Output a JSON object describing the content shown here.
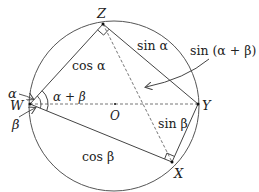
{
  "diagram": {
    "circle": {
      "cx": 114,
      "cy": 106,
      "r": 85,
      "stroke": "#555555"
    },
    "points": {
      "W": {
        "label": "W",
        "x": 30,
        "y": 104
      },
      "Z": {
        "label": "Z",
        "x": 103,
        "y": 24
      },
      "Y": {
        "label": "Y",
        "x": 198,
        "y": 104
      },
      "X": {
        "label": "X",
        "x": 172,
        "y": 162
      },
      "O": {
        "label": "O",
        "x": 115,
        "y": 104
      }
    },
    "edge_labels": {
      "WZ": "cos α",
      "ZY": "sin α",
      "WX": "cos β",
      "XY": "sin β",
      "ZX": "sin (α + β)"
    },
    "angle_labels": {
      "alpha": "α",
      "beta": "β",
      "alpha_plus_beta": "α + β"
    },
    "colors": {
      "solid_line": "#444444",
      "dashed_line": "#777777",
      "text": "#222222"
    }
  }
}
